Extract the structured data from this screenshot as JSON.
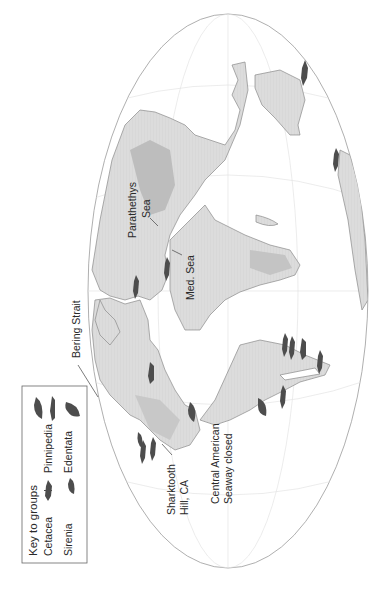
{
  "map": {
    "projection": "elliptical world map (rotated 90° counter-clockwise)",
    "colors": {
      "land": "#d9d9d9",
      "highland": "#bdbdbd",
      "coast": "#8a8a8a",
      "graticule": "#e3e3e3",
      "animal": "#4d4d4d",
      "text": "#2a2a2a"
    },
    "labels": {
      "parathethys_line1": "Parathethys",
      "parathethys_line2": "Sea",
      "med_sea": "Med. Sea",
      "bering_strait": "Bering Strait",
      "sharktooth_line1": "Sharktooth",
      "sharktooth_line2": "Hill, CA",
      "seaway_line1": "Central American",
      "seaway_line2": "Seaway closed"
    }
  },
  "legend": {
    "title": "Key to groups",
    "items": [
      {
        "label": "Cetacea",
        "icon": "whale-icon"
      },
      {
        "label": "Pinnipedia",
        "icon": "seal-icon"
      },
      {
        "label": "Sirenia",
        "icon": "sea-cow-icon"
      },
      {
        "label": "Edentata",
        "icon": "sloth-icon"
      }
    ]
  }
}
